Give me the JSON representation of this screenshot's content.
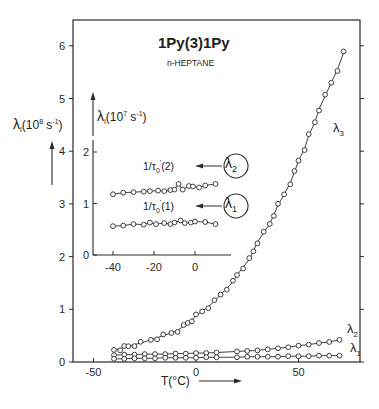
{
  "chart_data": [
    {
      "type": "scatter",
      "title": "1Py(3)1Py",
      "subtitle": "n-HEPTANE",
      "xlabel": "T(°C)",
      "ylabel": "λi (10^8 s^-1)",
      "ylabel_parts": {
        "sym": "λ",
        "sub": "i",
        "unit_pre": "(10",
        "exp": "8",
        "unit_mid": " s",
        "exp2": "-1",
        "unit_post": ")"
      },
      "xlim": [
        -60,
        80
      ],
      "ylim": [
        0,
        6.4
      ],
      "xticks": [
        -50,
        0,
        50
      ],
      "yticks": [
        0,
        1,
        2,
        3,
        4,
        5,
        6
      ],
      "grid": false,
      "series": [
        {
          "name": "λ3",
          "label_sym": "λ",
          "label_sub": "3",
          "x": [
            -40,
            -37,
            -35,
            -33,
            -30,
            -27,
            -22,
            -19,
            -16,
            -12,
            -9,
            -6,
            -4,
            -2,
            0,
            3,
            6,
            9,
            12,
            15,
            18,
            20,
            23,
            26,
            28,
            30,
            33,
            36,
            38,
            40,
            43,
            46,
            48,
            50,
            53,
            55,
            58,
            60,
            63,
            66,
            69,
            72
          ],
          "y": [
            0.23,
            0.25,
            0.28,
            0.3,
            0.33,
            0.36,
            0.42,
            0.46,
            0.5,
            0.55,
            0.6,
            0.68,
            0.74,
            0.8,
            0.88,
            0.96,
            1.05,
            1.15,
            1.28,
            1.4,
            1.52,
            1.65,
            1.8,
            1.95,
            2.1,
            2.28,
            2.45,
            2.62,
            2.8,
            2.98,
            3.18,
            3.4,
            3.6,
            3.82,
            4.05,
            4.3,
            4.55,
            4.8,
            5.05,
            5.3,
            5.55,
            5.87
          ]
        },
        {
          "name": "λ2",
          "label_sym": "λ",
          "label_sub": "2",
          "x": [
            -40,
            -35,
            -30,
            -25,
            -20,
            -15,
            -10,
            -5,
            0,
            5,
            10,
            20,
            25,
            30,
            35,
            40,
            45,
            50,
            55,
            60,
            65,
            70
          ],
          "y": [
            0.13,
            0.14,
            0.14,
            0.15,
            0.15,
            0.15,
            0.16,
            0.16,
            0.17,
            0.17,
            0.18,
            0.2,
            0.21,
            0.22,
            0.24,
            0.26,
            0.28,
            0.31,
            0.33,
            0.36,
            0.38,
            0.42
          ]
        },
        {
          "name": "λ1",
          "label_sym": "λ",
          "label_sub": "1",
          "x": [
            -40,
            -35,
            -30,
            -25,
            -20,
            -15,
            -10,
            -5,
            0,
            5,
            10,
            20,
            25,
            30,
            35,
            40,
            45,
            50,
            55,
            60,
            65,
            70
          ],
          "y": [
            0.06,
            0.06,
            0.07,
            0.07,
            0.07,
            0.08,
            0.08,
            0.08,
            0.08,
            0.09,
            0.09,
            0.09,
            0.1,
            0.1,
            0.1,
            0.1,
            0.11,
            0.11,
            0.11,
            0.12,
            0.12,
            0.12
          ]
        }
      ]
    },
    {
      "type": "scatter",
      "title": "inset",
      "xlabel": "",
      "ylabel": "λi (10^7 s^-1)",
      "ylabel_parts": {
        "sym": "λ",
        "sub": "i",
        "unit_pre": "(10",
        "exp": "7",
        "unit_mid": " s",
        "exp2": "-1",
        "unit_post": ")"
      },
      "xlim": [
        -50,
        17
      ],
      "ylim": [
        0,
        2.2
      ],
      "xticks": [
        -40,
        -20,
        0
      ],
      "yticks": [
        0,
        1,
        2
      ],
      "grid": false,
      "annotations": [
        {
          "text_pre": "1/τ",
          "sub": "0",
          "sup": "'",
          "text_post": "(2)",
          "arrow_to": "λ2"
        },
        {
          "text_pre": "1/τ",
          "sub": "0",
          "sup": "'",
          "text_post": "(1)",
          "arrow_to": "λ1"
        }
      ],
      "series": [
        {
          "name": "λ2 (inset)",
          "label_sym": "λ",
          "label_sub": "2",
          "x": [
            -40,
            -35,
            -30,
            -25,
            -22,
            -18,
            -15,
            -12,
            -10,
            -8,
            -6,
            -3,
            -1,
            2,
            5,
            10
          ],
          "y": [
            1.18,
            1.21,
            1.22,
            1.23,
            1.24,
            1.25,
            1.24,
            1.26,
            1.27,
            1.38,
            1.27,
            1.34,
            1.33,
            1.31,
            1.35,
            1.38
          ]
        },
        {
          "name": "λ1 (inset)",
          "label_sym": "λ",
          "label_sub": "1",
          "x": [
            -40,
            -35,
            -30,
            -25,
            -22,
            -19,
            -15,
            -12,
            -10,
            -7,
            -5,
            -2,
            0,
            5,
            10
          ],
          "y": [
            0.56,
            0.57,
            0.6,
            0.59,
            0.63,
            0.6,
            0.62,
            0.6,
            0.63,
            0.67,
            0.62,
            0.63,
            0.65,
            0.64,
            0.6
          ]
        }
      ]
    }
  ],
  "layout": {
    "line_color": "#2a2a2a",
    "text_color": "#222222",
    "background": "#ffffff"
  }
}
